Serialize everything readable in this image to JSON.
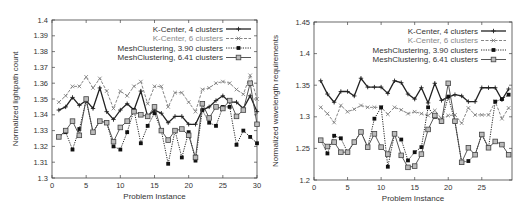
{
  "chart_data": [
    {
      "type": "line",
      "title": "",
      "xlabel": "Problem Instance",
      "ylabel": "Normalized lightpath count",
      "xlim": [
        0,
        30
      ],
      "ylim": [
        1.3,
        1.4
      ],
      "xticks": [
        "0",
        "5",
        "10",
        "15",
        "20",
        "25",
        "30"
      ],
      "yticks": [
        "1.3",
        "1.31",
        "1.32",
        "1.33",
        "1.34",
        "1.35",
        "1.36",
        "1.37",
        "1.38",
        "1.39",
        "1.4"
      ],
      "legend_position": "top-right",
      "grid": false,
      "x": [
        1,
        2,
        3,
        4,
        5,
        6,
        7,
        8,
        9,
        10,
        11,
        12,
        13,
        14,
        15,
        16,
        17,
        18,
        19,
        20,
        21,
        22,
        23,
        24,
        25,
        26,
        27,
        28,
        29,
        30
      ],
      "series": [
        {
          "name": "K-Center, 4 clusters",
          "style": "solid-plus",
          "color": "#222222",
          "values": [
            1.343,
            1.345,
            1.351,
            1.346,
            1.349,
            1.344,
            1.357,
            1.342,
            1.337,
            1.343,
            1.347,
            1.343,
            1.355,
            1.339,
            1.343,
            1.341,
            1.335,
            1.339,
            1.339,
            1.334,
            1.334,
            1.343,
            1.345,
            1.349,
            1.352,
            1.348,
            1.348,
            1.344,
            1.352,
            1.342
          ]
        },
        {
          "name": "K-Center, 6 clusters",
          "style": "dashed-x",
          "color": "#777777",
          "values": [
            1.348,
            1.352,
            1.358,
            1.358,
            1.364,
            1.357,
            1.363,
            1.355,
            1.344,
            1.355,
            1.352,
            1.358,
            1.361,
            1.347,
            1.358,
            1.358,
            1.345,
            1.354,
            1.354,
            1.348,
            1.342,
            1.356,
            1.357,
            1.36,
            1.361,
            1.36,
            1.356,
            1.353,
            1.365,
            1.35
          ]
        },
        {
          "name": "MeshClustering, 3.90 clusters",
          "style": "dotted-filled-square",
          "color": "#111111",
          "values": [
            1.326,
            1.329,
            1.318,
            1.331,
            1.349,
            1.329,
            1.336,
            1.335,
            1.32,
            1.318,
            1.329,
            1.343,
            1.322,
            1.333,
            1.341,
            1.33,
            1.309,
            1.33,
            1.313,
            1.329,
            1.311,
            1.343,
            1.335,
            1.333,
            1.345,
            1.345,
            1.321,
            1.33,
            1.326,
            1.322
          ]
        },
        {
          "name": "MeshClustering, 6.41 clusters",
          "style": "solid-open-square",
          "color": "#444444",
          "values": [
            1.326,
            1.33,
            1.336,
            1.327,
            1.35,
            1.329,
            1.336,
            1.335,
            1.323,
            1.332,
            1.336,
            1.342,
            1.34,
            1.339,
            1.345,
            1.33,
            1.324,
            1.33,
            1.331,
            1.327,
            1.313,
            1.347,
            1.338,
            1.345,
            1.344,
            1.349,
            1.339,
            1.343,
            1.36,
            1.334
          ]
        }
      ]
    },
    {
      "type": "line",
      "title": "",
      "xlabel": "Problem Instance",
      "ylabel": "Normalized wavelength requirements",
      "xlim": [
        0,
        29.5
      ],
      "ylim": [
        1.2,
        1.45
      ],
      "xticks": [
        "0",
        "5",
        "10",
        "15",
        "20",
        "25"
      ],
      "yticks": [
        "1.2",
        "1.25",
        "1.3",
        "1.35",
        "1.4",
        "1.45"
      ],
      "legend_position": "top-right",
      "grid": false,
      "x": [
        1,
        2,
        3,
        4,
        5,
        6,
        7,
        8,
        9,
        10,
        11,
        12,
        13,
        14,
        15,
        16,
        17,
        18,
        19,
        20,
        21,
        22,
        23,
        24,
        25,
        26,
        27,
        28,
        29
      ],
      "series": [
        {
          "name": "K-Center, 4 clusters",
          "style": "solid-plus",
          "color": "#222222",
          "values": [
            1.357,
            1.336,
            1.323,
            1.34,
            1.34,
            1.333,
            1.361,
            1.347,
            1.347,
            1.347,
            1.337,
            1.357,
            1.354,
            1.336,
            1.328,
            1.346,
            1.322,
            1.353,
            1.326,
            1.331,
            1.335,
            1.333,
            1.324,
            1.324,
            1.346,
            1.346,
            1.346,
            1.327,
            1.344
          ]
        },
        {
          "name": "K-Center, 6 clusters",
          "style": "dashed-x",
          "color": "#777777",
          "values": [
            1.315,
            1.305,
            1.291,
            1.318,
            1.308,
            1.312,
            1.318,
            1.315,
            1.315,
            1.315,
            1.304,
            1.315,
            1.311,
            1.305,
            1.308,
            1.305,
            1.302,
            1.31,
            1.297,
            1.302,
            1.303,
            1.29,
            1.314,
            1.303,
            1.303,
            1.303,
            1.324,
            1.297,
            1.314
          ]
        },
        {
          "name": "MeshClustering, 3.90 clusters",
          "style": "dotted-filled-square",
          "color": "#111111",
          "values": [
            1.263,
            1.242,
            1.27,
            1.266,
            1.244,
            1.26,
            1.276,
            1.252,
            1.297,
            1.315,
            1.221,
            1.273,
            1.264,
            1.231,
            1.244,
            1.252,
            1.315,
            1.3,
            1.292,
            1.332,
            1.292,
            1.228,
            1.23,
            1.24,
            1.272,
            1.251,
            1.324,
            1.328,
            1.335
          ]
        },
        {
          "name": "MeshClustering, 6.41 clusters",
          "style": "solid-open-square",
          "color": "#444444",
          "values": [
            1.263,
            1.253,
            1.26,
            1.244,
            1.244,
            1.26,
            1.276,
            1.252,
            1.273,
            1.252,
            1.241,
            1.273,
            1.239,
            1.22,
            1.222,
            1.241,
            1.28,
            1.302,
            1.293,
            1.353,
            1.293,
            1.228,
            1.251,
            1.24,
            1.272,
            1.251,
            1.261,
            1.256,
            1.24
          ]
        }
      ]
    }
  ]
}
